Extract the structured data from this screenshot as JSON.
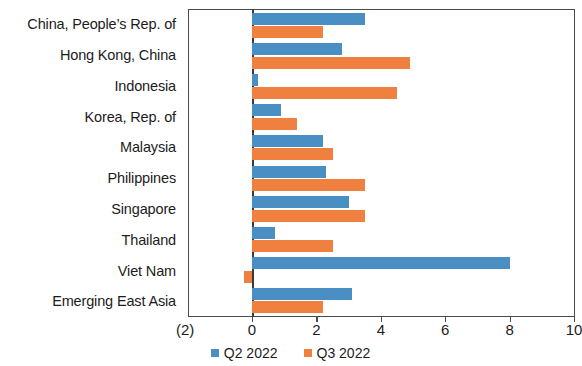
{
  "chart_data": {
    "type": "bar",
    "orientation": "horizontal",
    "title": "",
    "subtitle": "",
    "xlabel": "",
    "ylabel": "",
    "xlim": [
      -2,
      10
    ],
    "ylim": null,
    "grid": false,
    "legend_position": "bottom-center",
    "categories": [
      "China, People’s Rep. of",
      "Hong Kong, China",
      "Indonesia",
      "Korea, Rep. of",
      "Malaysia",
      "Philippines",
      "Singapore",
      "Thailand",
      "Viet Nam",
      "Emerging East Asia"
    ],
    "series": [
      {
        "name": "Q2 2022",
        "color": "#4a8fc4",
        "values": [
          3.5,
          2.8,
          0.2,
          0.9,
          2.2,
          2.3,
          3.0,
          0.7,
          8.0,
          3.1
        ]
      },
      {
        "name": "Q3 2022",
        "color": "#ef8040",
        "values": [
          2.2,
          4.9,
          4.5,
          1.4,
          2.5,
          3.5,
          3.5,
          2.5,
          -0.25,
          2.2
        ]
      }
    ],
    "x_ticks": [
      {
        "value": -2,
        "label": "(2)"
      },
      {
        "value": 0,
        "label": "0"
      },
      {
        "value": 2,
        "label": "2"
      },
      {
        "value": 4,
        "label": "4"
      },
      {
        "value": 6,
        "label": "6"
      },
      {
        "value": 8,
        "label": "8"
      },
      {
        "value": 10,
        "label": "10"
      }
    ],
    "legend": [
      {
        "label": "Q2 2022",
        "color": "#4a8fc4"
      },
      {
        "label": "Q3 2022",
        "color": "#ef8040"
      }
    ]
  },
  "axis": {
    "negative_tick_label": "(2)"
  }
}
